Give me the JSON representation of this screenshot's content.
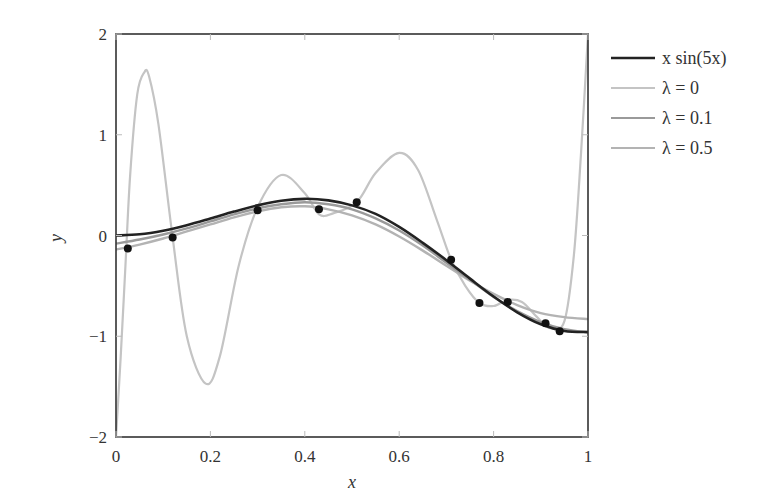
{
  "chart_data": {
    "type": "line",
    "title": "",
    "xlabel": "x",
    "ylabel": "y",
    "xlim": [
      0,
      1
    ],
    "ylim": [
      -2,
      2
    ],
    "xticks": [
      "0",
      "0.2",
      "0.4",
      "0.6",
      "0.8",
      "1"
    ],
    "yticks": [
      "-2",
      "-1",
      "0",
      "1",
      "2"
    ],
    "grid": false,
    "legend_position": "outside-right-top",
    "legend": [
      "x sin(5x)",
      "λ = 0",
      "λ = 0.1",
      "λ = 0.5"
    ],
    "data_points": {
      "x": [
        0.025,
        0.12,
        0.3,
        0.43,
        0.51,
        0.71,
        0.77,
        0.83,
        0.91,
        0.94
      ],
      "y": [
        -0.13,
        -0.02,
        0.25,
        0.26,
        0.33,
        -0.24,
        -0.67,
        -0.66,
        -0.87,
        -0.95
      ]
    },
    "series": [
      {
        "name": "x sin(5x)",
        "color": "#222222",
        "x": [
          0,
          0.05,
          0.1,
          0.15,
          0.2,
          0.25,
          0.3,
          0.35,
          0.4,
          0.45,
          0.5,
          0.55,
          0.6,
          0.65,
          0.7,
          0.75,
          0.8,
          0.85,
          0.9,
          0.95,
          1.0
        ],
        "values": [
          0,
          0.012,
          0.048,
          0.102,
          0.168,
          0.237,
          0.299,
          0.345,
          0.364,
          0.349,
          0.299,
          0.214,
          0.085,
          -0.073,
          -0.245,
          -0.428,
          -0.606,
          -0.762,
          -0.881,
          -0.947,
          -0.959
        ]
      },
      {
        "name": "λ = 0",
        "color": "#c4c4c4",
        "x": [
          0.0,
          0.01,
          0.02,
          0.03,
          0.045,
          0.06,
          0.07,
          0.09,
          0.12,
          0.15,
          0.19,
          0.22,
          0.26,
          0.3,
          0.35,
          0.4,
          0.43,
          0.46,
          0.51,
          0.55,
          0.6,
          0.64,
          0.68,
          0.71,
          0.74,
          0.77,
          0.8,
          0.83,
          0.86,
          0.89,
          0.92,
          0.95,
          0.97,
          0.985,
          1.0
        ],
        "values": [
          -2.0,
          -1.2,
          -0.3,
          0.6,
          1.4,
          1.62,
          1.58,
          1.1,
          -0.02,
          -1.0,
          -1.47,
          -1.2,
          -0.3,
          0.28,
          0.6,
          0.42,
          0.21,
          0.22,
          0.33,
          0.62,
          0.82,
          0.65,
          0.15,
          -0.24,
          -0.5,
          -0.67,
          -0.7,
          -0.64,
          -0.66,
          -0.8,
          -0.92,
          -0.85,
          -0.2,
          0.8,
          2.0
        ]
      },
      {
        "name": "λ = 0.1",
        "color": "#9a9a9a",
        "x": [
          0,
          0.05,
          0.1,
          0.15,
          0.2,
          0.25,
          0.3,
          0.35,
          0.4,
          0.45,
          0.5,
          0.55,
          0.6,
          0.65,
          0.7,
          0.75,
          0.8,
          0.85,
          0.9,
          0.95,
          1.0
        ],
        "values": [
          -0.08,
          -0.04,
          0.01,
          0.07,
          0.14,
          0.21,
          0.27,
          0.31,
          0.33,
          0.31,
          0.26,
          0.17,
          0.05,
          -0.1,
          -0.27,
          -0.44,
          -0.61,
          -0.75,
          -0.86,
          -0.93,
          -0.96
        ]
      },
      {
        "name": "λ = 0.5",
        "color": "#b3b3b3",
        "x": [
          0,
          0.05,
          0.1,
          0.15,
          0.2,
          0.25,
          0.3,
          0.35,
          0.4,
          0.45,
          0.5,
          0.55,
          0.6,
          0.65,
          0.7,
          0.75,
          0.8,
          0.85,
          0.9,
          0.95,
          1.0
        ],
        "values": [
          -0.14,
          -0.09,
          -0.03,
          0.04,
          0.11,
          0.18,
          0.24,
          0.28,
          0.29,
          0.26,
          0.2,
          0.11,
          -0.01,
          -0.15,
          -0.3,
          -0.45,
          -0.58,
          -0.69,
          -0.77,
          -0.81,
          -0.83
        ]
      }
    ]
  }
}
